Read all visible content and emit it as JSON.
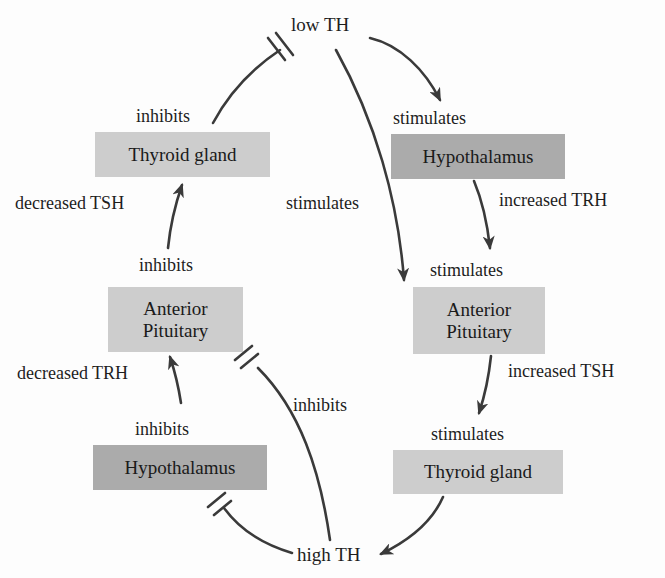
{
  "diagram": {
    "nodes": {
      "low_th": "low TH",
      "high_th": "high TH",
      "hypothalamus_right": "Hypothalamus",
      "pituitary_right": "Anterior Pituitary",
      "pituitary_right_line1": "Anterior",
      "pituitary_right_line2": "Pituitary",
      "thyroid_right": "Thyroid gland",
      "thyroid_left": "Thyroid gland",
      "pituitary_left_line1": "Anterior",
      "pituitary_left_line2": "Pituitary",
      "hypothalamus_left": "Hypothalamus"
    },
    "edge_labels": {
      "stimulates_hypothalamus": "stimulates",
      "stimulates_direct": "stimulates",
      "increased_trh": "increased TRH",
      "stimulates_pituitary": "stimulates",
      "increased_tsh": "increased TSH",
      "stimulates_thyroid": "stimulates",
      "inhibits_thyroid": "inhibits",
      "decreased_tsh": "decreased TSH",
      "inhibits_pituitary": "inhibits",
      "decreased_trh": "decreased TRH",
      "inhibits_hypothalamus": "inhibits",
      "inhibits_direct": "inhibits"
    },
    "colors": {
      "dark_box": "#ababab",
      "light_box": "#cdcdcd",
      "arrow": "#3a3a3a"
    }
  }
}
